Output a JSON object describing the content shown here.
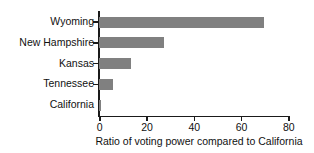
{
  "chart_data": {
    "type": "bar",
    "orientation": "horizontal",
    "title": "",
    "subtitle": "",
    "xlabel": "Ratio of voting power compared to California",
    "ylabel": "",
    "categories": [
      "Wyoming",
      "New Hampshire",
      "Kansas",
      "Tennessee",
      "California"
    ],
    "values": [
      70,
      27.5,
      13.5,
      6,
      1
    ],
    "xlim": [
      0,
      80
    ],
    "xticks": [
      0,
      20,
      40,
      60,
      80
    ],
    "xtick_labels": [
      "0",
      "20",
      "40",
      "60",
      "80"
    ],
    "grid": false,
    "legend": false,
    "legend_position": "none",
    "bar_color": "#808080",
    "axis_color": "#1a1a1a",
    "background_color": "#ffffff"
  }
}
